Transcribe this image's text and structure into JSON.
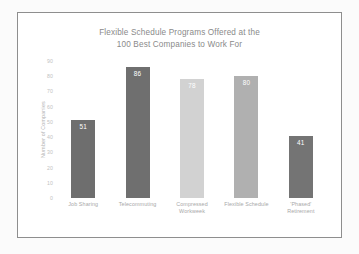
{
  "chart_data": {
    "type": "bar",
    "title": "Flexible Schedule Programs Offered at the 100 Best Companies to Work For",
    "title_line1": "Flexible Schedule Programs Offered at the",
    "title_line2": "100 Best Companies to Work For",
    "xlabel": "",
    "ylabel": "Number of Companies",
    "ylim": [
      0,
      90
    ],
    "ytick_step": 10,
    "yticks": [
      90,
      80,
      70,
      60,
      50,
      40,
      30,
      20,
      10,
      0
    ],
    "ytick_labels": [
      "90",
      "80",
      "70",
      "60",
      "50",
      "40",
      "30",
      "20",
      "10",
      "0"
    ],
    "grid": false,
    "legend": false,
    "categories": [
      "Job Sharing",
      "Telecommuting",
      "Compressed Workweek",
      "Flexible Schedule",
      "'Phased' Retirement"
    ],
    "category_lines": [
      [
        "Job Sharing",
        ""
      ],
      [
        "Telecommuting",
        ""
      ],
      [
        "Compressed",
        "Workweek"
      ],
      [
        "Flexible Schedule",
        ""
      ],
      [
        "'Phased'",
        "Retirement"
      ]
    ],
    "values": [
      51,
      86,
      78,
      80,
      41
    ],
    "value_labels": [
      "51",
      "86",
      "78",
      "80",
      "41"
    ],
    "bar_colors": [
      "#6e6e6e",
      "#6f6f6f",
      "#d2d2d2",
      "#b0b0b0",
      "#747474"
    ]
  },
  "style": {
    "frame_color": "#8e8e8e",
    "title_color": "#8a8a8a",
    "tick_color": "#c2c2c2",
    "axis_title_color": "#b4b4b4",
    "category_color": "#a8a8a8",
    "plot_background": "#ffffff",
    "page_background": "#fbfbfb"
  }
}
